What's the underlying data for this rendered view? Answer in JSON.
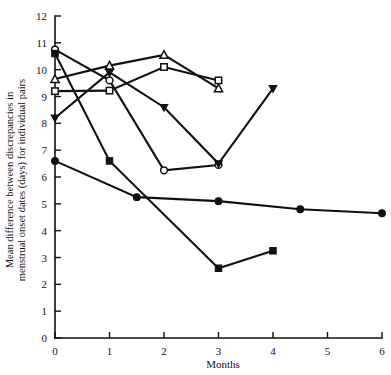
{
  "chart_data": {
    "type": "line",
    "title": "",
    "xlabel": "Months",
    "ylabel": "Mean difference between discrepancies in menstrual onset dates (days) for individual pairs",
    "xlim": [
      0,
      6
    ],
    "ylim": [
      0,
      12
    ],
    "xticks": [
      0,
      1,
      2,
      3,
      4,
      5,
      6
    ],
    "yticks": [
      0,
      1,
      2,
      3,
      4,
      5,
      6,
      7,
      8,
      9,
      10,
      11,
      12
    ],
    "xtick_labels": [
      "0",
      "1",
      "2",
      "3",
      "4",
      "5",
      "6"
    ],
    "ytick_labels": [
      "0",
      "1",
      "2",
      "3",
      "4",
      "5",
      "6",
      "7",
      "8",
      "9",
      "10",
      "11",
      "12"
    ],
    "grid": false,
    "legend": "none",
    "series": [
      {
        "name": "open-circle",
        "marker": "open-circle",
        "points": [
          [
            0,
            10.75
          ],
          [
            1,
            9.6
          ],
          [
            2,
            6.25
          ],
          [
            3,
            6.45
          ]
        ]
      },
      {
        "name": "filled-square",
        "marker": "filled-square",
        "points": [
          [
            0,
            10.6
          ],
          [
            1,
            6.6
          ],
          [
            3,
            2.6
          ],
          [
            4,
            3.25
          ]
        ]
      },
      {
        "name": "open-triangle",
        "marker": "open-triangle",
        "points": [
          [
            0,
            9.65
          ],
          [
            1,
            10.15
          ],
          [
            2,
            10.55
          ],
          [
            3,
            9.3
          ]
        ]
      },
      {
        "name": "open-square",
        "marker": "open-square",
        "points": [
          [
            0,
            9.2
          ],
          [
            1,
            9.22
          ],
          [
            2,
            10.1
          ],
          [
            3,
            9.6
          ]
        ]
      },
      {
        "name": "filled-triangle",
        "marker": "filled-triangle",
        "points": [
          [
            0,
            8.2
          ],
          [
            1,
            9.9
          ],
          [
            2,
            8.6
          ],
          [
            3,
            6.5
          ],
          [
            4,
            9.3
          ]
        ]
      },
      {
        "name": "filled-circle",
        "marker": "filled-circle",
        "points": [
          [
            0,
            6.6
          ],
          [
            1.5,
            5.25
          ],
          [
            3,
            5.1
          ],
          [
            4.5,
            4.8
          ],
          [
            6,
            4.65
          ]
        ]
      }
    ]
  },
  "labels": {
    "x_axis_title": "Months",
    "y_axis_title_line1": "Mean difference between discrepancies in",
    "y_axis_title_line2": "menstrual onset dates (days) for individual pairs"
  }
}
